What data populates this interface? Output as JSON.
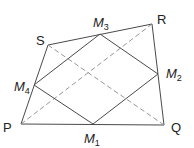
{
  "diagram": {
    "title": "",
    "vertices": {
      "P": {
        "label": "P",
        "x": 21,
        "y": 124
      },
      "Q": {
        "label": "Q",
        "x": 164,
        "y": 125
      },
      "R": {
        "label": "R",
        "x": 152,
        "y": 24
      },
      "S": {
        "label": "S",
        "x": 48,
        "y": 45
      }
    },
    "midpoints": {
      "M1": {
        "label": "M",
        "sub": "1",
        "x": 93,
        "y": 124
      },
      "M2": {
        "label": "M",
        "sub": "2",
        "x": 158,
        "y": 74
      },
      "M3": {
        "label": "M",
        "sub": "3",
        "x": 100,
        "y": 34
      },
      "M4": {
        "label": "M",
        "sub": "4",
        "x": 34,
        "y": 85
      }
    },
    "edges_solid": [
      "PQ",
      "QR",
      "RS",
      "SP",
      "M1M2",
      "M2M3",
      "M3M4",
      "M4M1"
    ],
    "edges_dashed": [
      "PR",
      "SQ"
    ],
    "colors": {
      "line": "#4a4a4a",
      "dashed": "#8a8a8a",
      "text": "#222222"
    }
  }
}
